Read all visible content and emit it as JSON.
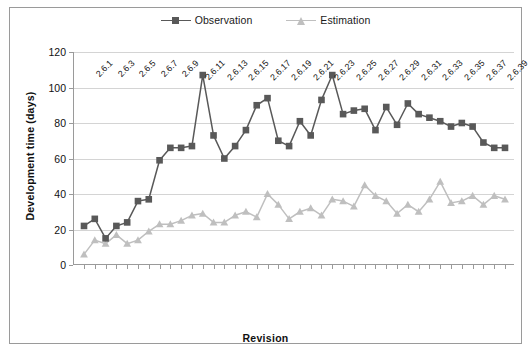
{
  "chart_data": {
    "type": "line",
    "title": "",
    "xlabel": "Revision",
    "ylabel": "Development time (days)",
    "ylim": [
      0,
      120
    ],
    "ytick_values": [
      0,
      20,
      40,
      60,
      80,
      100,
      120
    ],
    "grid": true,
    "legend_position": "top-center",
    "categories": [
      "2.6.1",
      "2.6.2",
      "2.6.3",
      "2.6.4",
      "2.6.5",
      "2.6.6",
      "2.6.7",
      "2.6.8",
      "2.6.9",
      "2.6.10",
      "2.6.11",
      "2.6.12",
      "2.6.13",
      "2.6.14",
      "2.6.15",
      "2.6.16",
      "2.6.17",
      "2.6.18",
      "2.6.19",
      "2.6.20",
      "2.6.21",
      "2.6.22",
      "2.6.23",
      "2.6.24",
      "2.6.25",
      "2.6.26",
      "2.6.27",
      "2.6.28",
      "2.6.29",
      "2.6.30",
      "2.6.31",
      "2.6.32",
      "2.6.33",
      "2.6.34",
      "2.6.35",
      "2.6.36",
      "2.6.37",
      "2.6.38",
      "2.6.39",
      "2.6.40"
    ],
    "xtick_labels": [
      "2.6.1",
      "2.6.3",
      "2.6.5",
      "2.6.7",
      "2.6.9",
      "2.6.11",
      "2.6.13",
      "2.6.15",
      "2.6.17",
      "2.6.19",
      "2.6.21",
      "2.6.23",
      "2.6.25",
      "2.6.27",
      "2.6.29",
      "2.6.31",
      "2.6.33",
      "2.6.35",
      "2.6.37",
      "2.6.39"
    ],
    "series": [
      {
        "name": "Observation",
        "color": "#595959",
        "marker": "square",
        "values": [
          22,
          26,
          15,
          22,
          24,
          36,
          37,
          59,
          66,
          66,
          67,
          107,
          73,
          60,
          67,
          76,
          90,
          94,
          70,
          67,
          81,
          73,
          93,
          107,
          85,
          87,
          88,
          76,
          89,
          79,
          91,
          85,
          83,
          81,
          78,
          80,
          78,
          69,
          66,
          66
        ]
      },
      {
        "name": "Estimation",
        "color": "#bfbfbf",
        "marker": "triangle",
        "values": [
          6,
          14,
          12,
          17,
          12,
          14,
          19,
          23,
          23,
          25,
          28,
          29,
          24,
          24,
          28,
          30,
          27,
          40,
          34,
          26,
          30,
          32,
          28,
          37,
          36,
          33,
          45,
          39,
          36,
          29,
          34,
          30,
          37,
          47,
          35,
          36,
          39,
          34,
          39,
          37
        ]
      }
    ]
  },
  "legend": {
    "entries": [
      {
        "label": "Observation"
      },
      {
        "label": "Estimation"
      }
    ]
  },
  "axes": {
    "y_title": "Development time (days)",
    "x_title": "Revision"
  },
  "colors": {
    "observation": "#595959",
    "estimation": "#bfbfbf",
    "gridline": "#d4d4d4",
    "axis": "#9a9a9a",
    "frame": "#9a9a9a"
  }
}
